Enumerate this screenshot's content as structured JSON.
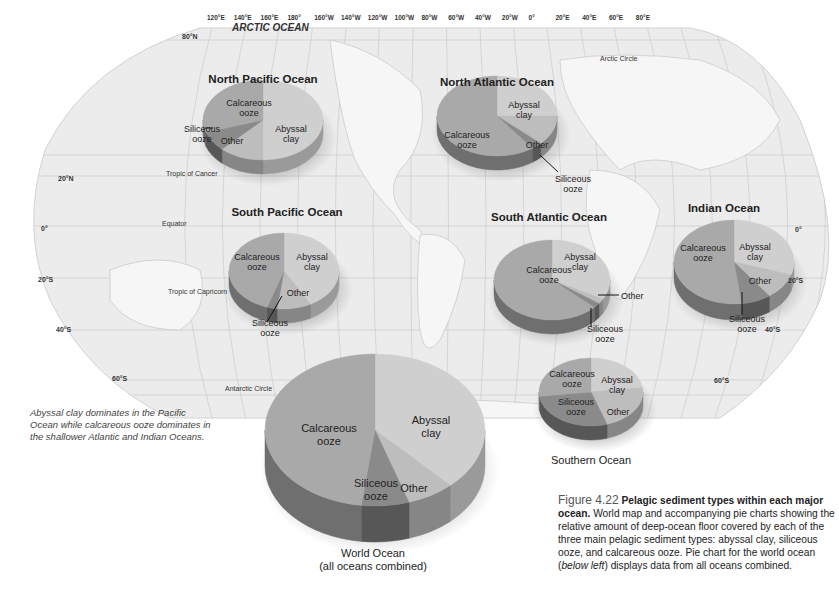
{
  "map": {
    "longitude_ticks": [
      "120°E",
      "140°E",
      "160°E",
      "180°",
      "160°W",
      "140°W",
      "120°W",
      "100°W",
      "80°W",
      "60°W",
      "40°W",
      "20°W",
      "0°",
      "20°E",
      "40°E",
      "60°E",
      "80°E"
    ],
    "latitude_labels": {
      "n80": "80°N",
      "n20": "20°N",
      "eq": "0°",
      "s20": "20°S",
      "s40": "40°S",
      "s60": "60°S",
      "e0": "0°",
      "e20s": "20°S",
      "e40s": "40°S",
      "e60s": "60°S"
    },
    "feature_labels": {
      "arctic_ocean": "ARCTIC OCEAN",
      "arctic_circle": "Arctic Circle",
      "tropic_cancer": "Tropic of Cancer",
      "equator": "Equator",
      "tropic_capricorn": "Tropic of Capricorn",
      "antarctic_circle": "Antarctic Circle"
    }
  },
  "side_note": "Abyssal clay dominates in the Pacific Ocean while calcareous ooze dominates in the shallower Atlantic and Indian Oceans.",
  "figure_caption": {
    "number": "Figure 4.22",
    "bold_title": "Pelagic sediment types within each major ocean.",
    "body_1": "World map and accompanying pie charts showing the relative amount of deep-ocean floor covered by each of the three main pelagic sediment types: abyssal clay, siliceous ooze, and calcareous ooze. Pie chart for the world ocean (",
    "italic": "below left",
    "body_2": ") displays data from all oceans combined."
  },
  "slice_labels": {
    "abyssal": "Abyssal\nclay",
    "calcareous": "Calcareous\nooze",
    "siliceous": "Siliceous\nooze",
    "other": "Other"
  },
  "colors": {
    "abyssal": "#cfcfcf",
    "calcareous": "#a9a9a9",
    "siliceous": "#8a8a8a",
    "other": "#bdbdbd",
    "abyssal_side": "#9a9a9a",
    "calcareous_side": "#6f6f6f",
    "siliceous_side": "#575757",
    "other_side": "#868686",
    "map_fill": "#ececec",
    "map_grid": "#c8c8c8"
  },
  "chart_data": [
    {
      "type": "pie",
      "title": "North Pacific Ocean",
      "categories": [
        "Abyssal clay",
        "Calcareous ooze",
        "Siliceous ooze",
        "Other"
      ],
      "values": [
        50,
        30,
        8,
        12
      ]
    },
    {
      "type": "pie",
      "title": "North Atlantic Ocean",
      "categories": [
        "Abyssal clay",
        "Calcareous ooze",
        "Siliceous ooze",
        "Other"
      ],
      "values": [
        25,
        60,
        3,
        12
      ]
    },
    {
      "type": "pie",
      "title": "South Pacific Ocean",
      "categories": [
        "Abyssal clay",
        "Calcareous ooze",
        "Siliceous ooze",
        "Other"
      ],
      "values": [
        42,
        45,
        3,
        10
      ]
    },
    {
      "type": "pie",
      "title": "South Atlantic Ocean",
      "categories": [
        "Abyssal clay",
        "Calcareous ooze",
        "Siliceous ooze",
        "Other"
      ],
      "values": [
        33,
        63,
        2,
        2
      ]
    },
    {
      "type": "pie",
      "title": "Indian Ocean",
      "categories": [
        "Abyssal clay",
        "Calcareous ooze",
        "Siliceous ooze",
        "Other"
      ],
      "values": [
        30,
        52,
        8,
        10
      ]
    },
    {
      "type": "pie",
      "title": "Southern Ocean",
      "categories": [
        "Abyssal clay",
        "Calcareous ooze",
        "Siliceous ooze",
        "Other"
      ],
      "values": [
        23,
        27,
        28,
        22
      ]
    },
    {
      "type": "pie",
      "title": "World Ocean (all oceans combined)",
      "categories": [
        "Abyssal clay",
        "Calcareous ooze",
        "Siliceous ooze",
        "Other"
      ],
      "values": [
        38,
        48,
        7,
        7
      ]
    }
  ],
  "pies": [
    {
      "id": "north-pacific",
      "title": "North Pacific Ocean",
      "cx": 263,
      "cy": 120,
      "rx": 60,
      "ry": 40,
      "depth": 14,
      "start": 0,
      "order": [
        "abyssal",
        "other",
        "siliceous",
        "calcareous"
      ],
      "values": {
        "abyssal": 50,
        "other": 12,
        "siliceous": 8,
        "calcareous": 30
      },
      "title_pos": [
        263,
        73
      ],
      "labels": [
        {
          "k": "abyssal",
          "x": 291,
          "y": 134
        },
        {
          "k": "calcareous",
          "x": 249,
          "y": 108
        },
        {
          "k": "other",
          "x": 232,
          "y": 141
        }
      ],
      "callouts": [
        {
          "k": "siliceous",
          "x": 184,
          "y": 124,
          "line": [
            205,
            128,
            213,
            128
          ]
        }
      ]
    },
    {
      "id": "north-atlantic",
      "title": "North Atlantic Ocean",
      "cx": 497,
      "cy": 116,
      "rx": 60,
      "ry": 40,
      "depth": 14,
      "start": 0,
      "order": [
        "abyssal",
        "other",
        "siliceous",
        "calcareous"
      ],
      "values": {
        "abyssal": 25,
        "other": 12,
        "siliceous": 3,
        "calcareous": 60
      },
      "title_pos": [
        497,
        76
      ],
      "labels": [
        {
          "k": "abyssal",
          "x": 524,
          "y": 110
        },
        {
          "k": "calcareous",
          "x": 467,
          "y": 140
        },
        {
          "k": "other",
          "x": 537,
          "y": 145
        }
      ],
      "callouts": [
        {
          "k": "siliceous",
          "x": 555,
          "y": 174,
          "line": [
            540,
            155,
            558,
            172
          ]
        }
      ]
    },
    {
      "id": "south-pacific",
      "title": "South Pacific Ocean",
      "cx": 284,
      "cy": 271,
      "rx": 55,
      "ry": 38,
      "depth": 14,
      "start": 0,
      "order": [
        "abyssal",
        "other",
        "siliceous",
        "calcareous"
      ],
      "values": {
        "abyssal": 42,
        "other": 10,
        "siliceous": 3,
        "calcareous": 45
      },
      "title_pos": [
        287,
        206
      ],
      "labels": [
        {
          "k": "abyssal",
          "x": 312,
          "y": 262
        },
        {
          "k": "calcareous",
          "x": 257,
          "y": 262
        },
        {
          "k": "other",
          "x": 298,
          "y": 293
        }
      ],
      "callouts": [
        {
          "k": "siliceous",
          "x": 252,
          "y": 318,
          "line": [
            267,
            322,
            282,
            296
          ]
        }
      ]
    },
    {
      "id": "south-atlantic",
      "title": "South Atlantic Ocean",
      "cx": 552,
      "cy": 280,
      "rx": 58,
      "ry": 40,
      "depth": 14,
      "start": 0,
      "order": [
        "abyssal",
        "other",
        "siliceous",
        "calcareous"
      ],
      "values": {
        "abyssal": 33,
        "other": 2,
        "siliceous": 2,
        "calcareous": 63
      },
      "title_pos": [
        549,
        211
      ],
      "labels": [
        {
          "k": "abyssal",
          "x": 580,
          "y": 262
        },
        {
          "k": "calcareous",
          "x": 549,
          "y": 275
        }
      ],
      "callouts": [
        {
          "k": "other",
          "x": 621,
          "y": 291,
          "line": [
            598,
            295,
            619,
            295
          ]
        },
        {
          "k": "siliceous",
          "x": 587,
          "y": 324,
          "line": [
            591,
            308,
            591,
            327
          ]
        }
      ]
    },
    {
      "id": "indian",
      "title": "Indian Ocean",
      "cx": 734,
      "cy": 262,
      "rx": 60,
      "ry": 42,
      "depth": 16,
      "start": 0,
      "order": [
        "abyssal",
        "other",
        "siliceous",
        "calcareous"
      ],
      "values": {
        "abyssal": 30,
        "other": 10,
        "siliceous": 8,
        "calcareous": 52
      },
      "title_pos": [
        724,
        202
      ],
      "labels": [
        {
          "k": "abyssal",
          "x": 755,
          "y": 252
        },
        {
          "k": "calcareous",
          "x": 703,
          "y": 253
        },
        {
          "k": "other",
          "x": 760,
          "y": 281
        }
      ],
      "callouts": [
        {
          "k": "siliceous",
          "x": 729,
          "y": 314,
          "line": [
            742,
            292,
            742,
            315
          ]
        }
      ]
    },
    {
      "id": "southern",
      "title": "Southern Ocean",
      "cx": 591,
      "cy": 392,
      "rx": 52,
      "ry": 34,
      "depth": 14,
      "start": 0,
      "order": [
        "abyssal",
        "other",
        "siliceous",
        "calcareous"
      ],
      "values": {
        "abyssal": 23,
        "other": 22,
        "siliceous": 28,
        "calcareous": 27
      },
      "title_pos": [
        591,
        454
      ],
      "labels": [
        {
          "k": "abyssal",
          "x": 617,
          "y": 385
        },
        {
          "k": "calcareous",
          "x": 572,
          "y": 379
        },
        {
          "k": "siliceous",
          "x": 576,
          "y": 407
        },
        {
          "k": "other",
          "x": 618,
          "y": 412
        }
      ],
      "callouts": []
    },
    {
      "id": "world",
      "title": "World Ocean\n(all oceans combined)",
      "cx": 375,
      "cy": 430,
      "rx": 110,
      "ry": 76,
      "depth": 36,
      "start": 0,
      "order": [
        "abyssal",
        "other",
        "siliceous",
        "calcareous"
      ],
      "values": {
        "abyssal": 38,
        "other": 7,
        "siliceous": 7,
        "calcareous": 48
      },
      "title_pos": [
        373,
        547
      ],
      "labels": [
        {
          "k": "abyssal",
          "x": 431,
          "y": 427
        },
        {
          "k": "calcareous",
          "x": 329,
          "y": 435
        },
        {
          "k": "siliceous",
          "x": 376,
          "y": 490
        },
        {
          "k": "other",
          "x": 414,
          "y": 488
        }
      ],
      "callouts": []
    }
  ]
}
